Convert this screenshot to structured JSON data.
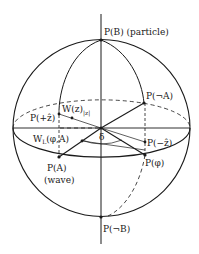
{
  "diagram": {
    "type": "bloch-sphere",
    "colors": {
      "line": "#1a1a1a",
      "background": "#ffffff"
    },
    "labels": {
      "north_pole": "P(B) (particle)",
      "south_pole": "P(¬B)",
      "not_a": "P(¬A)",
      "plus_z": "P(+ẑ)",
      "minus_z": "P(−ẑ)",
      "w_z_main": "W(z)",
      "w_z_sub": "|z|",
      "w_l_main": "W",
      "w_l_sub": "L",
      "w_l_args": "(φ,A)",
      "delta": "δ",
      "p_phi": "P(φ)",
      "p_a": "P(A)",
      "wave": "(wave)"
    }
  }
}
